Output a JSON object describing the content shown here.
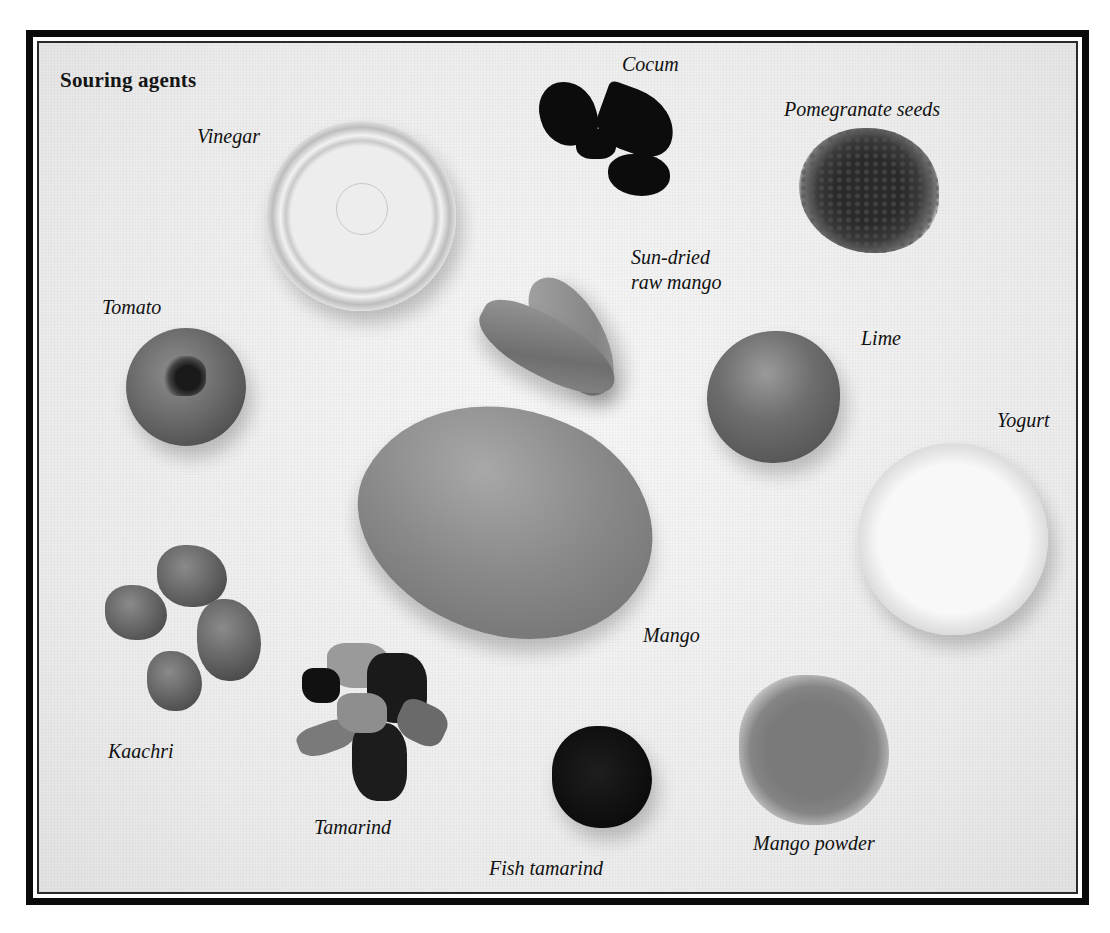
{
  "plate": {
    "title": "Souring agents",
    "style": "grayscale photograph",
    "colors": {
      "frame": "#0a0a0a",
      "background": "#eeeeee",
      "text": "#111111"
    }
  },
  "labels": {
    "vinegar": "Vinegar",
    "cocum": "Cocum",
    "pomegranate_seeds": "Pomegranate seeds",
    "sun_dried_line1": "Sun-dried",
    "sun_dried_line2": "raw mango",
    "tomato": "Tomato",
    "lime": "Lime",
    "yogurt": "Yogurt",
    "mango": "Mango",
    "kaachri": "Kaachri",
    "tamarind": "Tamarind",
    "fish_tamarind": "Fish tamarind",
    "mango_powder": "Mango powder"
  }
}
